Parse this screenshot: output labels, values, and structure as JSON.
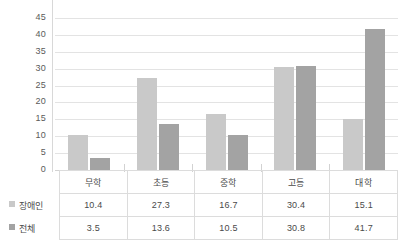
{
  "chart_data": {
    "type": "bar",
    "title": "",
    "subtitle": "",
    "xlabel": "",
    "ylabel": "",
    "ylim": [
      0,
      45
    ],
    "ytick_step": 5,
    "yticks": [
      45,
      40,
      35,
      30,
      25,
      20,
      15,
      10,
      5,
      0
    ],
    "grid": true,
    "legend_position": "table-left",
    "categories": [
      "무학",
      "초등",
      "중학",
      "고등",
      "대학"
    ],
    "series": [
      {
        "name": "장애인",
        "color": "#c9c9c9",
        "values": [
          10.4,
          27.3,
          16.7,
          30.4,
          15.1
        ]
      },
      {
        "name": "전체",
        "color": "#a3a3a3",
        "values": [
          3.5,
          13.6,
          10.5,
          30.8,
          41.7
        ]
      }
    ]
  },
  "table": {
    "corner_blank": "",
    "row_labels": [
      "장애인",
      "전체"
    ],
    "column_headers": [
      "무학",
      "초등",
      "중학",
      "고등",
      "대학"
    ],
    "rows": [
      [
        "10.4",
        "27.3",
        "16.7",
        "30.4",
        "15.1"
      ],
      [
        "3.5",
        "13.6",
        "10.5",
        "30.8",
        "41.7"
      ]
    ]
  },
  "colors": {
    "series1": "#c9c9c9",
    "series2": "#a3a3a3",
    "gridline": "#e3e3e3",
    "axis": "#d2d2d2",
    "table_border": "#dcdcdc",
    "text": "#4a4a4a",
    "tick_text": "#5a5a5a",
    "background": "#ffffff"
  },
  "caption": {
    "text": ""
  }
}
